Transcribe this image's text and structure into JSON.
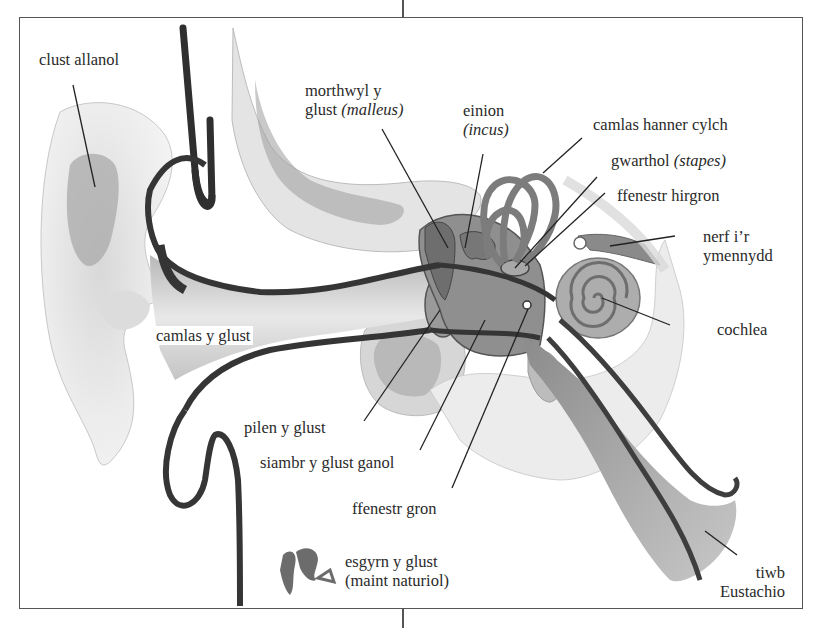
{
  "diagram": {
    "title": "",
    "language": "Welsh",
    "colors": {
      "frame": "#555555",
      "ink": "#2a2a2a",
      "tissue_light": "#e6e6e6",
      "tissue_mid": "#b5b5b5",
      "tissue_dark": "#7a7a7a",
      "outline": "#3c3c3c"
    },
    "labels": {
      "clust_allanol": "clust allanol",
      "morthwyl_line1": "morthwyl y",
      "morthwyl_line2_prefix": "glust ",
      "morthwyl_latin": "(malleus)",
      "einion": "einion",
      "einion_latin": "(incus)",
      "camlas_hanner_cylch": "camlas hanner cylch",
      "gwarthol_prefix": "gwarthol ",
      "gwarthol_latin": "(stapes)",
      "ffenestr_hirgron": "ffenestr hirgron",
      "nerf_line1": "nerf i’r",
      "nerf_line2": "ymennydd",
      "cochlea": "cochlea",
      "camlas_y_glust": "camlas y glust",
      "pilen_y_glust": "pilen y glust",
      "siambr_y_glust_ganol": "siambr y glust ganol",
      "ffenestr_gron": "ffenestr gron",
      "esgyrn_line1": "esgyrn y glust",
      "esgyrn_line2": "(maint naturiol)",
      "tiwb_line1": "tiwb",
      "tiwb_line2": "Eustachio"
    },
    "parts": [
      {
        "id": "outer-ear",
        "label": "clust allanol",
        "english": "outer ear"
      },
      {
        "id": "malleus",
        "label": "morthwyl y glust (malleus)",
        "english": "hammer"
      },
      {
        "id": "incus",
        "label": "einion (incus)",
        "english": "anvil"
      },
      {
        "id": "semicircular-canal",
        "label": "camlas hanner cylch",
        "english": "semicircular canal"
      },
      {
        "id": "stapes",
        "label": "gwarthol (stapes)",
        "english": "stirrup"
      },
      {
        "id": "oval-window",
        "label": "ffenestr hirgron",
        "english": "oval window"
      },
      {
        "id": "auditory-nerve",
        "label": "nerf i’r ymennydd",
        "english": "nerve to the brain"
      },
      {
        "id": "cochlea",
        "label": "cochlea",
        "english": "cochlea"
      },
      {
        "id": "ear-canal",
        "label": "camlas y glust",
        "english": "ear canal"
      },
      {
        "id": "eardrum",
        "label": "pilen y glust",
        "english": "eardrum"
      },
      {
        "id": "middle-ear",
        "label": "siambr y glust ganol",
        "english": "middle ear chamber"
      },
      {
        "id": "round-window",
        "label": "ffenestr gron",
        "english": "round window"
      },
      {
        "id": "ossicles-actual-size",
        "label": "esgyrn y glust (maint naturiol)",
        "english": "ear bones (actual size)"
      },
      {
        "id": "eustachian-tube",
        "label": "tiwb Eustachio",
        "english": "Eustachian tube"
      }
    ]
  }
}
